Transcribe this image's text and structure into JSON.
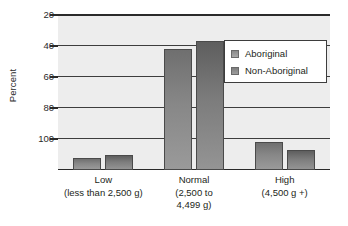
{
  "chart_data": {
    "type": "bar",
    "title": "",
    "xlabel": "",
    "ylabel": "Percent",
    "ylim": [
      0,
      100
    ],
    "yticks": [
      20,
      40,
      60,
      80,
      100
    ],
    "ytick_labels": [
      "20",
      "40",
      "60",
      "80",
      "100"
    ],
    "grid": true,
    "legend_position": "upper right",
    "categories": [
      "Low",
      "Normal",
      "High"
    ],
    "category_sublabels": [
      "(less than 2,500 g)",
      "(2,500 to\n4,499 g)",
      "(4,500 g +)"
    ],
    "series": [
      {
        "name": "Aboriginal",
        "values": [
          8,
          78,
          18
        ],
        "color": "#878787"
      },
      {
        "name": "Non-Aboriginal",
        "values": [
          10,
          83,
          13
        ],
        "color": "#7c7c7c"
      }
    ]
  },
  "axis": {
    "y_title": "Percent",
    "ticks": [
      {
        "label": "100",
        "value": 100
      },
      {
        "label": "80",
        "value": 80
      },
      {
        "label": "60",
        "value": 60
      },
      {
        "label": "40",
        "value": 40
      },
      {
        "label": "20",
        "value": 20
      }
    ]
  },
  "legend": {
    "entries": [
      {
        "label": "Aboriginal",
        "swatch": "series-a-swatch"
      },
      {
        "label": "Non-Aboriginal",
        "swatch": "series-b-swatch"
      }
    ]
  },
  "xaxis": {
    "groups": [
      {
        "name": "Low",
        "line1": "Low",
        "line2": "(less than 2,500 g)",
        "line3": ""
      },
      {
        "name": "Normal",
        "line1": "Normal",
        "line2": "(2,500 to",
        "line3": "4,499 g)"
      },
      {
        "name": "High",
        "line1": "High",
        "line2": "(4,500 g +)",
        "line3": ""
      }
    ]
  }
}
